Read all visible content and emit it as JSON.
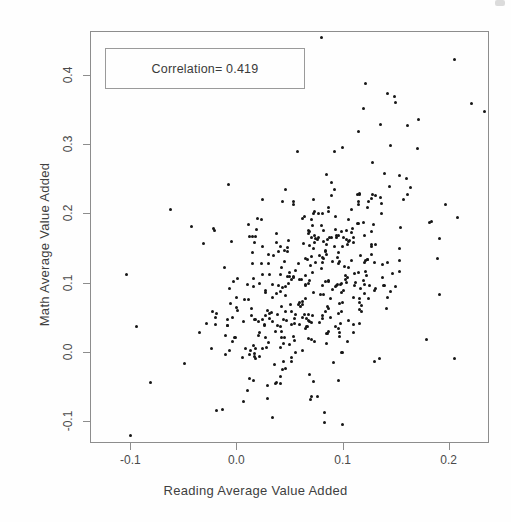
{
  "chart_data": {
    "type": "scatter",
    "title": "",
    "xlabel": "Reading Average Value Added",
    "ylabel": "Math Average Value Added",
    "xlim": [
      -0.138,
      0.238
    ],
    "ylim": [
      -0.131,
      0.463
    ],
    "xticks": [
      -0.1,
      0.0,
      0.1,
      0.2
    ],
    "xticklabels": [
      "-0.1",
      "0.0",
      "0.1",
      "0.2"
    ],
    "yticks": [
      -0.1,
      0.0,
      0.1,
      0.2,
      0.3,
      0.4
    ],
    "yticklabels": [
      "-0.1",
      "0.0",
      "0.1",
      "0.2",
      "0.3",
      "0.4"
    ],
    "grid": false,
    "legend": null,
    "correlation": 0.419,
    "n_points": 430,
    "marker": {
      "shape": "circle",
      "color": "#161616",
      "size_px": 3
    },
    "annotations": [
      {
        "name": "correlation-box",
        "text": "Correlation= 0.419",
        "x_px": 105,
        "y_px": 48,
        "w_px": 200,
        "h_px": 41
      }
    ],
    "distribution": {
      "x_mean": 0.068,
      "x_sd": 0.048,
      "y_mean": 0.108,
      "y_sd": 0.077,
      "rho": 0.419,
      "seed": 20240419
    },
    "outliers": [
      {
        "x": 0.079,
        "y": 0.455
      },
      {
        "x": 0.205,
        "y": 0.423
      },
      {
        "x": 0.121,
        "y": 0.389
      },
      {
        "x": 0.141,
        "y": 0.374
      },
      {
        "x": 0.148,
        "y": 0.37
      },
      {
        "x": 0.149,
        "y": 0.362
      },
      {
        "x": 0.221,
        "y": 0.36
      },
      {
        "x": 0.233,
        "y": 0.348
      },
      {
        "x": 0.171,
        "y": 0.337
      },
      {
        "x": 0.135,
        "y": 0.33
      },
      {
        "x": 0.16,
        "y": 0.328
      },
      {
        "x": 0.114,
        "y": 0.32
      },
      {
        "x": 0.144,
        "y": 0.299
      },
      {
        "x": 0.099,
        "y": 0.297
      },
      {
        "x": -0.063,
        "y": 0.207
      },
      {
        "x": -0.105,
        "y": 0.113
      },
      {
        "x": -0.095,
        "y": 0.039
      },
      {
        "x": -0.082,
        "y": -0.042
      },
      {
        "x": -0.101,
        "y": -0.119
      },
      {
        "x": -0.02,
        "y": -0.082
      },
      {
        "x": 0.207,
        "y": 0.196
      },
      {
        "x": 0.196,
        "y": 0.214
      },
      {
        "x": 0.19,
        "y": 0.084
      },
      {
        "x": 0.178,
        "y": 0.019
      },
      {
        "x": 0.205,
        "y": -0.008
      },
      {
        "x": 0.033,
        "y": -0.093
      },
      {
        "x": 0.07,
        "y": -0.063
      }
    ]
  },
  "chart": {
    "correlation_label": "Correlation= 0.419",
    "xlabel": "Reading Average Value Added",
    "ylabel": "Math Average Value Added"
  }
}
